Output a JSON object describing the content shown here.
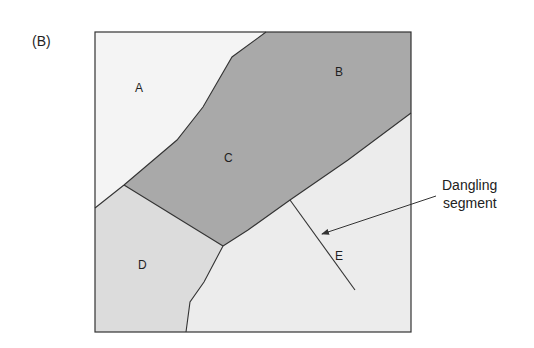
{
  "panel_label": "(B)",
  "regions": [
    {
      "id": "A",
      "label": "A",
      "fill": "#f3f3f3"
    },
    {
      "id": "B",
      "label": "B",
      "fill": "#a9a9a9"
    },
    {
      "id": "C",
      "label": "C",
      "fill": "#a9a9a9"
    },
    {
      "id": "D",
      "label": "D",
      "fill": "#dcdcdc"
    },
    {
      "id": "E",
      "label": "E",
      "fill": "#ececec"
    }
  ],
  "annotation": {
    "line1": "Dangling",
    "line2": "segment"
  },
  "colors": {
    "border": "#333333",
    "dark_region": "#a9a9a9",
    "light_region": "#f3f3f3",
    "mid_region": "#dcdcdc",
    "e_region": "#ececec"
  }
}
